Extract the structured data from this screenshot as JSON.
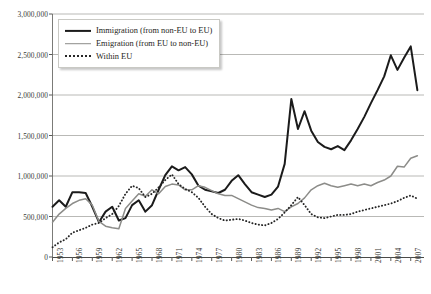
{
  "chart_data": {
    "type": "line",
    "title": "",
    "xlabel": "",
    "ylabel": "",
    "grid": true,
    "legend_position": "top-left",
    "ylim": [
      0,
      3000000
    ],
    "ytick_values": [
      0,
      500000,
      1000000,
      1500000,
      2000000,
      2500000,
      3000000
    ],
    "ytick_labels": [
      "0",
      "500,000",
      "1,000,000",
      "1,500,000",
      "2,000,000",
      "2,500,000",
      "3,000,000"
    ],
    "xlim": [
      1953,
      2009
    ],
    "xtick_labels": [
      "1953",
      "1956",
      "1959",
      "1962",
      "1965",
      "1968",
      "1971",
      "1974",
      "1977",
      "1980",
      "1983",
      "1986",
      "1989",
      "1992",
      "1995",
      "1998",
      "2001",
      "2004",
      "2007"
    ],
    "xtick_values": [
      1953,
      1956,
      1959,
      1962,
      1965,
      1968,
      1971,
      1974,
      1977,
      1980,
      1983,
      1986,
      1989,
      1992,
      1995,
      1998,
      2001,
      2004,
      2007
    ],
    "x": [
      1953,
      1954,
      1955,
      1956,
      1957,
      1958,
      1959,
      1960,
      1961,
      1962,
      1963,
      1964,
      1965,
      1966,
      1967,
      1968,
      1969,
      1970,
      1971,
      1972,
      1973,
      1974,
      1975,
      1976,
      1977,
      1978,
      1979,
      1980,
      1981,
      1982,
      1983,
      1984,
      1985,
      1986,
      1987,
      1988,
      1989,
      1990,
      1991,
      1992,
      1993,
      1994,
      1995,
      1996,
      1997,
      1998,
      1999,
      2000,
      2001,
      2002,
      2003,
      2004,
      2005,
      2006,
      2007,
      2008
    ],
    "series": [
      {
        "name": "Immigration (from non-EU to EU)",
        "color": "#1b1b1b",
        "style": "solid",
        "values": [
          620000,
          700000,
          620000,
          800000,
          800000,
          790000,
          620000,
          430000,
          560000,
          620000,
          450000,
          480000,
          640000,
          700000,
          560000,
          640000,
          830000,
          1010000,
          1120000,
          1070000,
          1110000,
          1020000,
          880000,
          830000,
          810000,
          790000,
          830000,
          940000,
          1010000,
          900000,
          800000,
          770000,
          740000,
          770000,
          870000,
          1150000,
          1950000,
          1580000,
          1800000,
          1560000,
          1420000,
          1360000,
          1330000,
          1370000,
          1320000,
          1440000,
          1580000,
          1730000,
          1900000,
          2060000,
          2230000,
          2490000,
          2310000,
          2460000,
          2600000,
          2060000
        ],
        "peak_value": 2600000,
        "peak_year": 2007,
        "end_value": 2060000
      },
      {
        "name": "Emigration (from EU to non-EU)",
        "color": "#8c8c89",
        "style": "solid",
        "values": [
          430000,
          530000,
          600000,
          660000,
          700000,
          720000,
          640000,
          440000,
          380000,
          360000,
          350000,
          600000,
          690000,
          780000,
          750000,
          830000,
          780000,
          870000,
          900000,
          890000,
          830000,
          830000,
          880000,
          860000,
          820000,
          780000,
          760000,
          760000,
          720000,
          680000,
          640000,
          610000,
          600000,
          580000,
          600000,
          560000,
          620000,
          660000,
          730000,
          830000,
          880000,
          910000,
          880000,
          860000,
          880000,
          900000,
          880000,
          900000,
          880000,
          920000,
          950000,
          1000000,
          1120000,
          1110000,
          1220000,
          1250000
        ],
        "end_value": 1250000
      },
      {
        "name": "Within EU",
        "color": "#262626",
        "style": "dotted",
        "values": [
          120000,
          180000,
          220000,
          300000,
          330000,
          360000,
          400000,
          420000,
          480000,
          530000,
          630000,
          780000,
          880000,
          850000,
          740000,
          780000,
          860000,
          950000,
          1020000,
          900000,
          840000,
          800000,
          730000,
          620000,
          530000,
          480000,
          450000,
          460000,
          470000,
          450000,
          420000,
          400000,
          390000,
          420000,
          470000,
          550000,
          640000,
          740000,
          640000,
          530000,
          490000,
          480000,
          500000,
          520000,
          520000,
          530000,
          560000,
          580000,
          600000,
          620000,
          640000,
          660000,
          690000,
          730000,
          760000,
          720000
        ]
      }
    ]
  },
  "legend": {
    "items": [
      {
        "label": "Immigration (from non-EU to EU)"
      },
      {
        "label": "Emigration (from EU to non-EU)"
      },
      {
        "label": "Within EU"
      }
    ]
  }
}
